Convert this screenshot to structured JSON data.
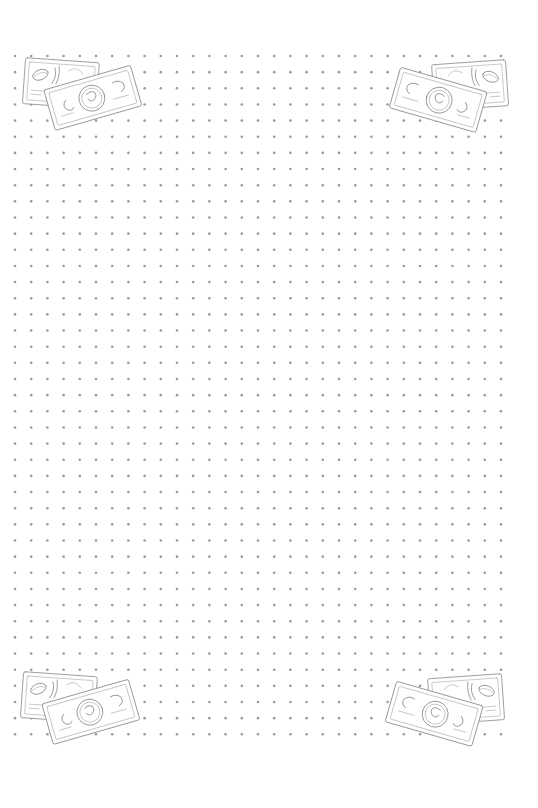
{
  "page": {
    "type": "dot-grid-paper",
    "background": "#ffffff",
    "dot_color": "#9a9a9a"
  },
  "grid": {
    "columns": 31,
    "rows": 43,
    "origin_x": 15,
    "origin_y": 56,
    "spacing_x": 16.2,
    "spacing_y": 16.15,
    "dot_radius": 1.3
  },
  "decorations": [
    {
      "name": "money-bills-top-left",
      "icon": "banknotes-icon",
      "x": 18,
      "y": 54
    },
    {
      "name": "money-bills-top-right",
      "icon": "banknotes-icon",
      "x": 388,
      "y": 56,
      "mirror": true
    },
    {
      "name": "money-bills-bottom-left",
      "icon": "banknotes-icon",
      "x": 16,
      "y": 668
    },
    {
      "name": "money-bills-bottom-right",
      "icon": "banknotes-icon",
      "x": 384,
      "y": 670,
      "mirror": true
    }
  ]
}
